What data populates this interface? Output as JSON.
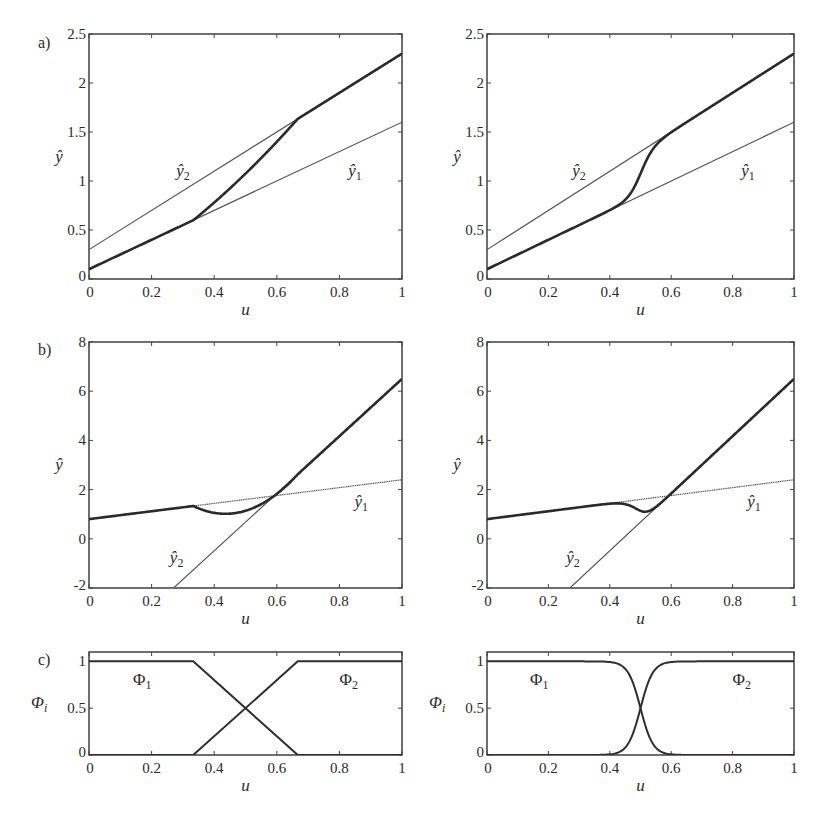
{
  "figure": {
    "panel_labels": [
      "a)",
      "b)",
      "c)"
    ],
    "x_axis_label": "u",
    "y_axis_label_ab": "ŷ",
    "y_axis_label_c": "Φ",
    "y_axis_label_c_sub": "i",
    "x_ticks": [
      "0",
      "0.2",
      "0.4",
      "0.6",
      "0.8",
      "1"
    ]
  },
  "chart_data": [
    {
      "id": "a-left",
      "panel": "a)",
      "column": "left (linear/trapezoid interpolation)",
      "type": "line",
      "xlabel": "u",
      "ylabel": "ŷ",
      "xlim": [
        0,
        1
      ],
      "ylim": [
        0,
        2.5
      ],
      "yticks": [
        "0",
        "0.5",
        "1",
        "1.5",
        "2",
        "2.5"
      ],
      "series": [
        {
          "name": "ŷ1",
          "style": "thin",
          "x": [
            0,
            1
          ],
          "y": [
            0.1,
            1.6
          ]
        },
        {
          "name": "ŷ2",
          "style": "thin",
          "x": [
            0,
            1
          ],
          "y": [
            0.3,
            2.3
          ]
        },
        {
          "name": "ŷ",
          "style": "thick",
          "blend": "trapezoid",
          "x": [
            0,
            0.333,
            0.5,
            0.667,
            1
          ],
          "y": [
            0.1,
            0.6,
            1.1,
            1.63,
            2.3
          ]
        }
      ],
      "annotations": [
        {
          "text": "ŷ",
          "sub": "2",
          "u": 0.3,
          "y": 1.05
        },
        {
          "text": "ŷ",
          "sub": "1",
          "u": 0.85,
          "y": 1.05
        }
      ]
    },
    {
      "id": "a-right",
      "panel": "a)",
      "column": "right (smooth interpolation)",
      "type": "line",
      "xlabel": "u",
      "ylabel": "ŷ",
      "xlim": [
        0,
        1
      ],
      "ylim": [
        0,
        2.5
      ],
      "yticks": [
        "0",
        "0.5",
        "1",
        "1.5",
        "2",
        "2.5"
      ],
      "series": [
        {
          "name": "ŷ1",
          "style": "thin",
          "x": [
            0,
            1
          ],
          "y": [
            0.1,
            1.6
          ]
        },
        {
          "name": "ŷ2",
          "style": "thin",
          "x": [
            0,
            1
          ],
          "y": [
            0.3,
            2.3
          ]
        },
        {
          "name": "ŷ",
          "style": "thick",
          "blend": "smooth",
          "x": [
            0,
            0.4,
            0.5,
            0.6,
            1
          ],
          "y": [
            0.1,
            0.7,
            1.1,
            1.5,
            2.3
          ]
        }
      ],
      "annotations": [
        {
          "text": "ŷ",
          "sub": "2",
          "u": 0.3,
          "y": 1.05
        },
        {
          "text": "ŷ",
          "sub": "1",
          "u": 0.85,
          "y": 1.05
        }
      ]
    },
    {
      "id": "b-left",
      "panel": "b)",
      "column": "left (linear/trapezoid interpolation)",
      "type": "line",
      "xlabel": "u",
      "ylabel": "ŷ",
      "xlim": [
        0,
        1
      ],
      "ylim": [
        -2,
        8
      ],
      "yticks": [
        "-2",
        "0",
        "2",
        "4",
        "6",
        "8"
      ],
      "series": [
        {
          "name": "ŷ1",
          "style": "thin-dotted",
          "x": [
            0,
            1
          ],
          "y": [
            0.8,
            2.4
          ]
        },
        {
          "name": "ŷ2",
          "style": "thin",
          "x": [
            0.27,
            1
          ],
          "y": [
            -2,
            6.5
          ]
        },
        {
          "name": "ŷ",
          "style": "thick",
          "blend": "trapezoid",
          "x": [
            0,
            0.333,
            0.45,
            0.6,
            1
          ],
          "y": [
            0.8,
            1.33,
            1.05,
            1.85,
            6.5
          ]
        }
      ],
      "annotations": [
        {
          "text": "ŷ",
          "sub": "2",
          "u": 0.28,
          "y": -1.0
        },
        {
          "text": "ŷ",
          "sub": "1",
          "u": 0.87,
          "y": 1.3
        }
      ]
    },
    {
      "id": "b-right",
      "panel": "b)",
      "column": "right (smooth interpolation)",
      "type": "line",
      "xlabel": "u",
      "ylabel": "ŷ",
      "xlim": [
        0,
        1
      ],
      "ylim": [
        -2,
        8
      ],
      "yticks": [
        "-2",
        "0",
        "2",
        "4",
        "6",
        "8"
      ],
      "series": [
        {
          "name": "ŷ1",
          "style": "thin-dotted",
          "x": [
            0,
            1
          ],
          "y": [
            0.8,
            2.4
          ]
        },
        {
          "name": "ŷ2",
          "style": "thin",
          "x": [
            0.27,
            1
          ],
          "y": [
            -2,
            6.5
          ]
        },
        {
          "name": "ŷ",
          "style": "thick",
          "blend": "smooth",
          "x": [
            0,
            0.4,
            0.5,
            0.6,
            1
          ],
          "y": [
            0.8,
            1.35,
            1.15,
            1.85,
            6.5
          ]
        }
      ],
      "annotations": [
        {
          "text": "ŷ",
          "sub": "2",
          "u": 0.28,
          "y": -1.0
        },
        {
          "text": "ŷ",
          "sub": "1",
          "u": 0.87,
          "y": 1.3
        }
      ]
    },
    {
      "id": "c-left",
      "panel": "c)",
      "column": "left",
      "type": "line",
      "xlabel": "u",
      "ylabel": "Φi",
      "xlim": [
        0,
        1
      ],
      "ylim": [
        0,
        1.1
      ],
      "yticks": [
        "0",
        "0.5",
        "1"
      ],
      "series": [
        {
          "name": "Φ1",
          "shape": "trapezoid",
          "x": [
            0,
            0.333,
            0.667,
            1
          ],
          "y": [
            1,
            1,
            0,
            0
          ]
        },
        {
          "name": "Φ2",
          "shape": "trapezoid",
          "x": [
            0,
            0.333,
            0.667,
            1
          ],
          "y": [
            0,
            0,
            1,
            1
          ]
        }
      ],
      "annotations": [
        {
          "text": "Φ",
          "sub": "1",
          "u": 0.17,
          "y": 0.75
        },
        {
          "text": "Φ",
          "sub": "2",
          "u": 0.83,
          "y": 0.75
        }
      ]
    },
    {
      "id": "c-right",
      "panel": "c)",
      "column": "right",
      "type": "line",
      "xlabel": "u",
      "ylabel": "Φi",
      "xlim": [
        0,
        1
      ],
      "ylim": [
        0,
        1.1
      ],
      "yticks": [
        "0",
        "0.5",
        "1"
      ],
      "series": [
        {
          "name": "Φ1",
          "shape": "smooth-sigmoid",
          "x": [
            0,
            0.3,
            0.4,
            0.5,
            0.6,
            0.7,
            1
          ],
          "y": [
            1,
            0.99,
            0.88,
            0.5,
            0.12,
            0.01,
            0
          ]
        },
        {
          "name": "Φ2",
          "shape": "smooth-sigmoid",
          "x": [
            0,
            0.3,
            0.4,
            0.5,
            0.6,
            0.7,
            1
          ],
          "y": [
            0,
            0.01,
            0.12,
            0.5,
            0.88,
            0.99,
            1
          ]
        }
      ],
      "annotations": [
        {
          "text": "Φ",
          "sub": "1",
          "u": 0.17,
          "y": 0.75
        },
        {
          "text": "Φ",
          "sub": "2",
          "u": 0.83,
          "y": 0.75
        }
      ]
    }
  ]
}
